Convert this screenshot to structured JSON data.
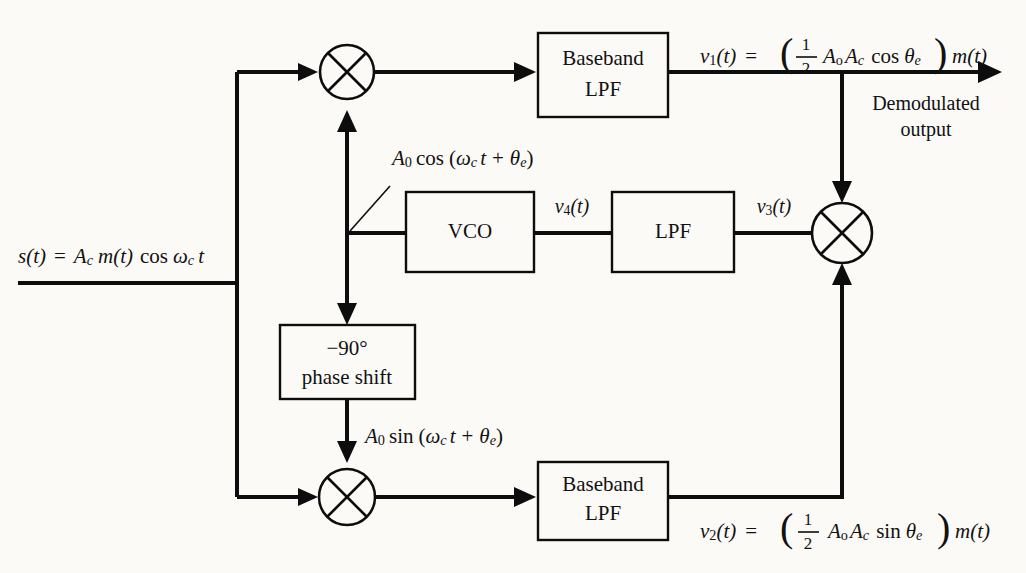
{
  "figure": {
    "background_color": "#fbfaf7",
    "line_color": "#0d0d0d"
  },
  "input": {
    "label_plain": "s(t) = A_c m(t) cos ω_c t",
    "s": "s",
    "t_paren": "(t)",
    "equals": "=",
    "A": "A",
    "A_sub": "c",
    "m_t": "m(t)",
    "cos": "cos",
    "omega": "ω",
    "omega_sub": "c",
    "t_tail": "t"
  },
  "blocks": {
    "baseband_lpf_top": {
      "line1": "Baseband",
      "line2": "LPF"
    },
    "baseband_lpf_bottom": {
      "line1": "Baseband",
      "line2": "LPF"
    },
    "vco": {
      "line1": "VCO"
    },
    "loop_lpf": {
      "line1": "LPF"
    },
    "phase_shift": {
      "line1": "−90°",
      "line2": "phase shift"
    }
  },
  "mixers": {
    "top": {
      "name": "multiplier-top",
      "symbol": "×"
    },
    "bottom": {
      "name": "multiplier-bottom",
      "symbol": "×"
    },
    "loop": {
      "name": "multiplier-loop",
      "symbol": "×"
    }
  },
  "signals": {
    "v1": {
      "lhs_v": "v",
      "lhs_sub": "1",
      "lhs_t": "(t)",
      "equals": "=",
      "frac_num": "1",
      "frac_den": "2",
      "A_o": "A",
      "A_o_sub": "o",
      "A_c": "A",
      "A_c_sub": "c",
      "trig": "cos",
      "theta": "θ",
      "theta_sub": "e",
      "tail": "m(t)",
      "plain": "v1(t) = ( 1/2 Ao Ac cos θe ) m(t)"
    },
    "v2": {
      "lhs_v": "v",
      "lhs_sub": "2",
      "lhs_t": "(t)",
      "equals": "=",
      "frac_num": "1",
      "frac_den": "2",
      "A_o": "A",
      "A_o_sub": "o",
      "A_c": "A",
      "A_c_sub": "c",
      "trig": "sin",
      "theta": "θ",
      "theta_sub": "e",
      "tail": "m(t)",
      "plain": "v2(t) = ( 1/2 Ao Ac sin θe ) m(t)"
    },
    "v3": {
      "v": "v",
      "sub": "3",
      "t": "(t)",
      "plain": "v3(t)"
    },
    "v4": {
      "v": "v",
      "sub": "4",
      "t": "(t)",
      "plain": "v4(t)"
    },
    "vco_cos": {
      "A": "A",
      "A_sub": "0",
      "trig": "cos",
      "open": "(",
      "omega": "ω",
      "omega_sub": "c",
      "t": "t",
      "plus": "+",
      "theta": "θ",
      "theta_sub": "e",
      "close": ")",
      "plain": "A0 cos (ωc t + θe)"
    },
    "vco_sin": {
      "A": "A",
      "A_sub": "0",
      "trig": "sin",
      "open": "(",
      "omega": "ω",
      "omega_sub": "c",
      "t": "t",
      "plus": "+",
      "theta": "θ",
      "theta_sub": "e",
      "close": ")",
      "plain": "A0 sin (ωc t + θe)"
    }
  },
  "annotations": {
    "demodulated_output": {
      "line1": "Demodulated",
      "line2": "output"
    }
  }
}
